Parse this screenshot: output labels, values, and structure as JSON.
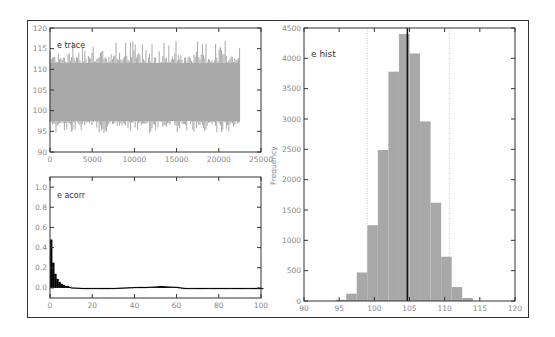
{
  "chart_data": [
    {
      "type": "line",
      "title": "e trace",
      "xlabel": "",
      "ylabel": "",
      "xlim": [
        0,
        25000
      ],
      "ylim": [
        90,
        120
      ],
      "xticks": [
        "0",
        "5000",
        "10000",
        "15000",
        "20000",
        "25000"
      ],
      "yticks": [
        "90",
        "95",
        "100",
        "105",
        "110",
        "115",
        "120"
      ],
      "series": [
        {
          "name": "e",
          "n_samples": 22500,
          "center": 104.7,
          "band_low": 97.5,
          "band_high": 111.5,
          "min": 94.5,
          "max": 117
        }
      ],
      "grid": false,
      "color": "#a8a8a8"
    },
    {
      "type": "bar",
      "title": "e acorr",
      "xlabel": "",
      "ylabel": "",
      "xlim": [
        0,
        100
      ],
      "ylim": [
        -0.1,
        1.1
      ],
      "xticks": [
        "0",
        "20",
        "40",
        "60",
        "80",
        "100"
      ],
      "yticks": [
        "0.0",
        "0.2",
        "0.4",
        "0.6",
        "0.8",
        "1.0"
      ],
      "x": [
        0,
        1,
        2,
        3,
        4,
        5,
        6,
        7,
        8,
        9,
        10,
        15,
        20,
        30,
        40,
        45,
        50,
        52,
        55,
        60,
        65,
        70,
        80,
        90,
        100
      ],
      "values": [
        0.48,
        0.25,
        0.14,
        0.09,
        0.06,
        0.04,
        0.03,
        0.02,
        0.02,
        0.01,
        0.005,
        0.0,
        -0.005,
        0.0,
        0.01,
        0.01,
        0.015,
        0.02,
        0.015,
        0.01,
        -0.005,
        0.0,
        0.0,
        0.0,
        0.0
      ],
      "grid": false,
      "color": "#000000"
    },
    {
      "type": "bar",
      "title": "e hist",
      "xlabel": "",
      "ylabel": "Frequency",
      "xlim": [
        90,
        120
      ],
      "ylim": [
        0,
        4500
      ],
      "xticks": [
        "90",
        "95",
        "100",
        "105",
        "110",
        "115",
        "120"
      ],
      "yticks": [
        "0",
        "500",
        "1000",
        "1500",
        "2000",
        "2500",
        "3000",
        "3500",
        "4000",
        "4500"
      ],
      "bin_edges": [
        94.5,
        96,
        97.5,
        99,
        100.5,
        102,
        103.5,
        105,
        106.5,
        108,
        109.5,
        111,
        112.5,
        114
      ],
      "values": [
        20,
        120,
        470,
        1250,
        2490,
        3780,
        4400,
        4080,
        2960,
        1620,
        730,
        230,
        50
      ],
      "mean_line": 104.7,
      "quantile_lines": [
        99.0,
        110.7
      ],
      "grid": false,
      "color": "#a8a8a8"
    }
  ],
  "panels": {
    "trace": {
      "title": "e trace"
    },
    "acorr": {
      "title": "e acorr"
    },
    "hist": {
      "title": "e hist",
      "ylabel": "Frequency"
    }
  }
}
